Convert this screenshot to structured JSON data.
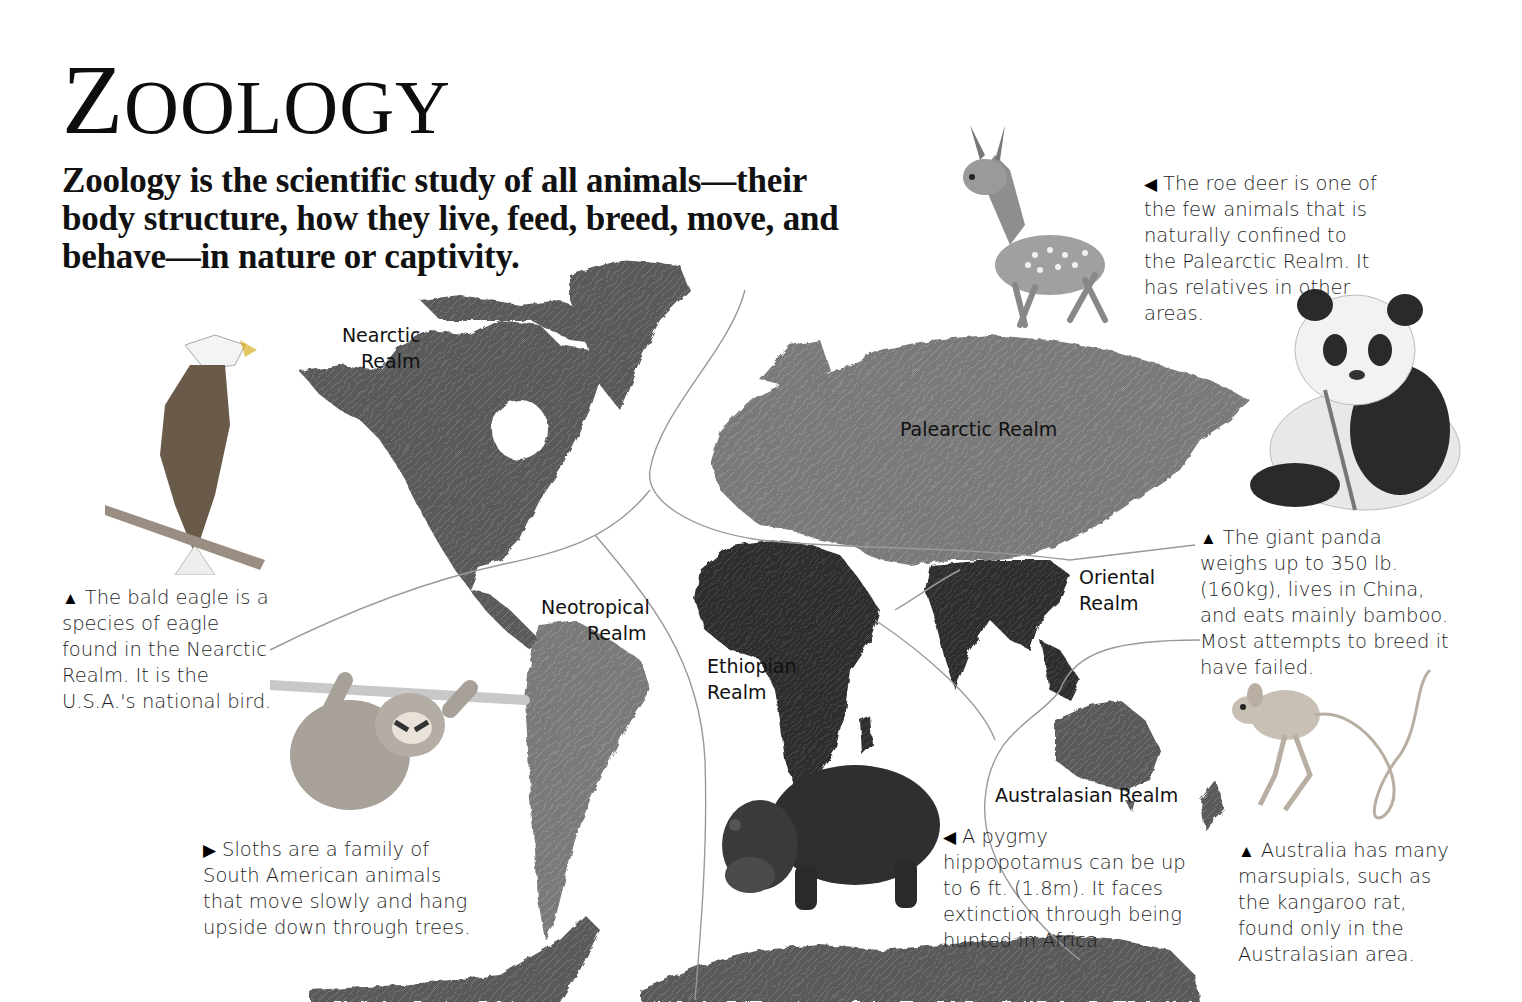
{
  "page": {
    "title_first": "Z",
    "title_rest": "OOLOGY",
    "intro": "Zoology is the scientific study of all animals—their body structure, how they live, feed, breed, move, and behave—in nature or captivity."
  },
  "realms": {
    "nearctic": {
      "line1": "Nearctic",
      "line2": "Realm"
    },
    "palearctic": {
      "line1": "Palearctic Realm"
    },
    "neotropical": {
      "line1": "Neotropical",
      "line2": "Realm"
    },
    "ethiopian": {
      "line1": "Ethiopian",
      "line2": "Realm"
    },
    "oriental": {
      "line1": "Oriental",
      "line2": "Realm"
    },
    "australasian": {
      "line1": "Australasian Realm"
    }
  },
  "captions": {
    "roe_deer": {
      "pointer": "◀",
      "text": "The roe deer is one of the few animals that is naturally confined to the Palearctic Realm. It has relatives in other areas."
    },
    "panda": {
      "pointer": "▲",
      "text": "The giant panda weighs up to 350 lb. (160kg), lives in China, and eats mainly bamboo. Most attempts to breed it have failed."
    },
    "eagle": {
      "pointer": "▲",
      "text": "The bald eagle is a species of eagle found in the Nearctic Realm. It is the U.S.A.'s national bird."
    },
    "sloth": {
      "pointer": "▶",
      "text": "Sloths are a family of South American animals that move slowly and hang upside down through trees."
    },
    "hippo": {
      "pointer": "◀",
      "text": "A pygmy hippopotamus can be up to 6 ft. (1.8m). It faces extinction through being hunted in Africa."
    },
    "kangaroo_rat": {
      "pointer": "▲",
      "text": "Australia has many marsupials, such as the kangaroo rat, found only in the Australasian area."
    }
  },
  "colors": {
    "land_dark": "#3a3a3a",
    "land_mid": "#6e6e6e",
    "land_light": "#8a8a8a",
    "boundary": "#9a9a9a"
  }
}
